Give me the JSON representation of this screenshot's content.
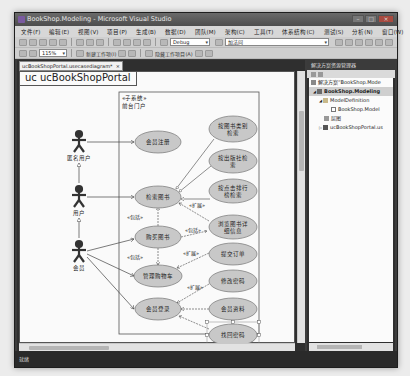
{
  "window": {
    "title": "BookShop.Modeling - Microsoft Visual Studio",
    "controls": [
      "minimize",
      "maximize",
      "close"
    ]
  },
  "menubar": {
    "items": [
      "文件(F)",
      "编辑(E)",
      "视图(V)",
      "项目(P)",
      "生成(B)",
      "数据(D)",
      "团队(M)",
      "架构(C)",
      "工具(T)",
      "体系结构(C)",
      "测试(S)",
      "分析(N)",
      "窗口(W)",
      "帮助(H)"
    ]
  },
  "toolbar1": {
    "configuration": "Debug",
    "search_combo": "加法问"
  },
  "toolbar2": {
    "zoom": "115%",
    "new_tool_label": "新建工作项(I)",
    "new_tool2_label": "隐藏工作项目(A)"
  },
  "document": {
    "tab_label": "ucBookShopPortal.usecasediagram*",
    "tab_close": "×",
    "diagram_title": "uc ucBookShopPortal"
  },
  "diagram": {
    "system": {
      "stereotype": "«子系统»",
      "name": "前台门户"
    },
    "actors": [
      {
        "id": "anon",
        "label": "匿名用户"
      },
      {
        "id": "user",
        "label": "用户"
      },
      {
        "id": "member",
        "label": "会员"
      }
    ],
    "usecases": [
      {
        "id": "register",
        "label": "会员注册"
      },
      {
        "id": "search_category",
        "label": [
          "按图书类别",
          "检索"
        ]
      },
      {
        "id": "search_publisher",
        "label": [
          "按出版社检",
          "索"
        ]
      },
      {
        "id": "search_rank",
        "label": [
          "按点击排行",
          "榜检索"
        ]
      },
      {
        "id": "search",
        "label": "检索图书"
      },
      {
        "id": "view_detail",
        "label": [
          "浏览图书详",
          "细信息"
        ]
      },
      {
        "id": "buy",
        "label": "购买图书"
      },
      {
        "id": "submit_order",
        "label": "提交订单"
      },
      {
        "id": "cart",
        "label": "管理购物车"
      },
      {
        "id": "change_pwd",
        "label": "修改密码"
      },
      {
        "id": "login",
        "label": "会员登录"
      },
      {
        "id": "profile",
        "label": "会员资料"
      },
      {
        "id": "recover_pwd",
        "label": "找回密码"
      }
    ],
    "stereotypes": {
      "include": "«包括»",
      "extend": "«扩展»"
    }
  },
  "solution_explorer": {
    "title": "解决方案资源管理器",
    "items": [
      {
        "label": "解决方案“BookShop.Mode",
        "level": 0
      },
      {
        "label": "BookShop.Modeling",
        "level": 1,
        "selected": true
      },
      {
        "label": "ModelDefinition",
        "level": 2
      },
      {
        "label": "BookShop.Model",
        "level": 3
      },
      {
        "label": "层图",
        "level": 2
      },
      {
        "label": "ucBookShopPortal.us",
        "level": 2
      }
    ]
  },
  "statusbar": {
    "text": "就绪"
  },
  "colors": {
    "usecase_fill": "#c8c8c8",
    "chrome_dark": "#2f2f2f",
    "canvas": "#fafafa"
  }
}
